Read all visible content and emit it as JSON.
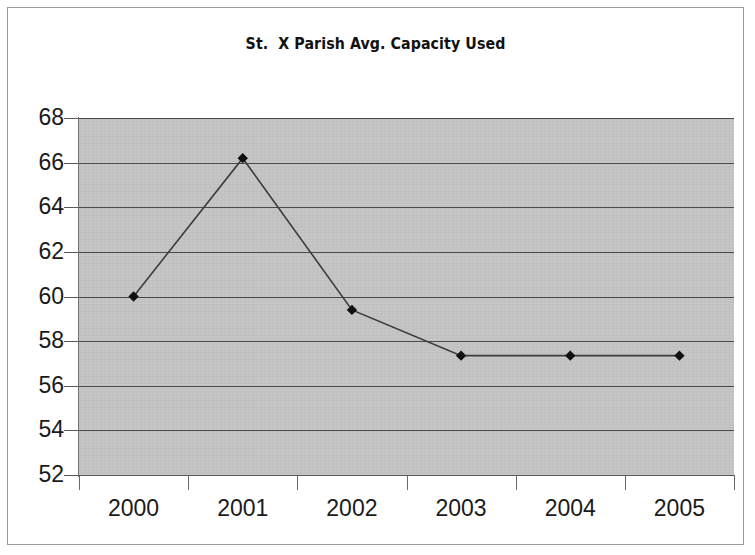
{
  "chart_data": {
    "type": "line",
    "title": "St.  X Parish Avg. Capacity Used",
    "xlabel": "",
    "ylabel": "",
    "categories": [
      "2000",
      "2001",
      "2002",
      "2003",
      "2004",
      "2005"
    ],
    "values": [
      60.0,
      66.2,
      59.4,
      57.35,
      57.35,
      57.35
    ],
    "series": [
      {
        "name": "Avg. Capacity Used",
        "values": [
          60.0,
          66.2,
          59.4,
          57.35,
          57.35,
          57.35
        ]
      }
    ],
    "ylim": [
      52,
      68
    ],
    "yticks": [
      68,
      66,
      64,
      62,
      60,
      58,
      56,
      54,
      52
    ],
    "ytick_labels": [
      "68",
      "66",
      "64",
      "62",
      "60",
      "58",
      "56",
      "54",
      "52"
    ],
    "xtick_labels": [
      "2000",
      "2001",
      "2002",
      "2003",
      "2004",
      "2005"
    ],
    "grid": true,
    "grid_axis": "y",
    "legend": false,
    "legend_position": "none",
    "marker": "diamond",
    "marker_color": "#101010",
    "line_color": "#3c3c3c",
    "plot_background": "#c3c3c3",
    "figure_background": "#ffffff",
    "border_color": "#9a9a9a"
  },
  "colors": {
    "plot_bg": "#c3c3c3",
    "page_bg": "#ffffff",
    "gridline": "#4a4a4a",
    "axis": "#5a5a5a",
    "text": "#1a1a1a",
    "line": "#3c3c3c",
    "marker": "#101010",
    "frame": "#9a9a9a"
  }
}
